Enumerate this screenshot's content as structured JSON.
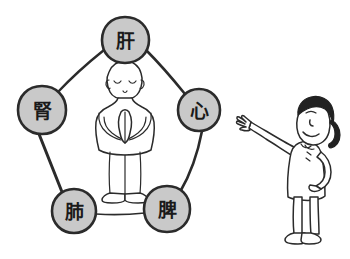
{
  "illustration": {
    "title": "Five Zang Organs Pentagon Diagram",
    "background_color": "#ffffff",
    "ink_color": "#2b2b2b",
    "node_fill_color": "#c9c9c9"
  },
  "pentagon": {
    "name": "five-organ-pentagon",
    "edge_color": "#2b2b2b",
    "nodes": [
      {
        "id": "liver",
        "label": "肝",
        "position": "top",
        "cx": 125,
        "cy": 40,
        "r": 23
      },
      {
        "id": "heart",
        "label": "心",
        "position": "right",
        "cx": 199,
        "cy": 110,
        "r": 21
      },
      {
        "id": "spleen",
        "label": "脾",
        "position": "bottom-right",
        "cx": 167,
        "cy": 209,
        "r": 23
      },
      {
        "id": "lung",
        "label": "肺",
        "position": "bottom-left",
        "cx": 74,
        "cy": 211,
        "r": 22
      },
      {
        "id": "kidney",
        "label": "腎",
        "position": "left",
        "cx": 42,
        "cy": 110,
        "r": 24
      }
    ]
  },
  "center_figure": {
    "name": "meditating-figure",
    "description": "bald figure standing with hands pressed together in prayer, eyes closed"
  },
  "side_figure": {
    "name": "pointing-person",
    "description": "smiling person with ponytail, left arm raised and open hand, right hand on hip"
  }
}
